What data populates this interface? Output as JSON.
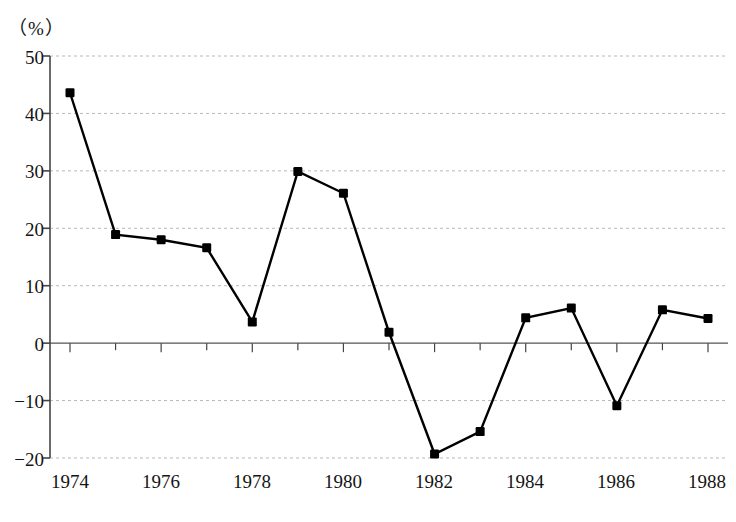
{
  "chart_data": {
    "type": "line",
    "title": "",
    "subtitle": "",
    "xlabel": "",
    "ylabel": "",
    "unit_label": "（%）",
    "x": [
      1974,
      1975,
      1976,
      1977,
      1978,
      1979,
      1980,
      1981,
      1982,
      1983,
      1984,
      1985,
      1986,
      1987,
      1988
    ],
    "values": [
      43.6,
      18.9,
      18.0,
      16.6,
      3.7,
      29.9,
      26.1,
      1.9,
      -19.3,
      -15.4,
      4.4,
      6.1,
      -10.9,
      5.8,
      4.3
    ],
    "series": [
      {
        "name": "series-1",
        "values": [
          43.6,
          18.9,
          18.0,
          16.6,
          3.7,
          29.9,
          26.1,
          1.9,
          -19.3,
          -15.4,
          4.4,
          6.1,
          -10.9,
          5.8,
          4.3
        ]
      }
    ],
    "xlim": [
      1974,
      1988
    ],
    "ylim": [
      -20,
      50
    ],
    "yticks": [
      50,
      40,
      30,
      20,
      10,
      0,
      -10,
      -20
    ],
    "ytick_labels": [
      "50",
      "40",
      "30",
      "20",
      "10",
      "0",
      "−10",
      "−20"
    ],
    "xticks": [
      1974,
      1976,
      1978,
      1980,
      1982,
      1984,
      1986,
      1988
    ],
    "xtick_labels": [
      "1974",
      "1976",
      "1978",
      "1980",
      "1982",
      "1984",
      "1986",
      "1988"
    ],
    "x_minor_ticks": [
      1975,
      1977,
      1979,
      1981,
      1983,
      1985,
      1987
    ],
    "grid": true,
    "grid_axis": "y",
    "grid_style": "dashed",
    "grid_color": "#b8b8b8",
    "legend": null,
    "legend_position": "none",
    "marker": "square",
    "marker_color": "#000000",
    "line_color": "#000000",
    "line_width": 2.4,
    "zero_line": true,
    "zero_line_color": "#555555",
    "background_color": "#ffffff",
    "axis_color": "#444444"
  },
  "axis": {
    "unit_label": "（%）"
  }
}
